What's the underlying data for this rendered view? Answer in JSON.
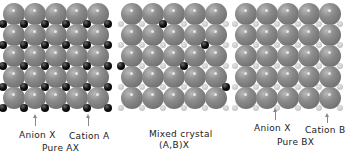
{
  "figure": {
    "panels": [
      {
        "id": "pure-ax",
        "labels": {
          "anion": "Anion X",
          "cation": "Cation A",
          "title": "Pure AX"
        },
        "grid": {
          "rows": 5,
          "cols": 5,
          "cation_type": "A"
        }
      },
      {
        "id": "mixed",
        "labels": {
          "title": "Mixed crystal",
          "subtitle": "(A,B)X"
        },
        "grid": {
          "rows": 5,
          "cols": 5,
          "cation_type": "B",
          "substituted_A_positions": [
            [
              0,
              2
            ],
            [
              1,
              4
            ],
            [
              2,
              0
            ],
            [
              2,
              3
            ],
            [
              3,
              5
            ]
          ]
        }
      },
      {
        "id": "pure-bx",
        "labels": {
          "anion": "Anion X",
          "cation": "Cation B",
          "title": "Pure BX"
        },
        "grid": {
          "rows": 5,
          "cols": 5,
          "cation_type": "B"
        }
      }
    ],
    "colors": {
      "anion": "#7a7a7a",
      "cation_a": "#0a0a0a",
      "cation_b": "#c9c9c9",
      "background": "#ffffff"
    }
  }
}
